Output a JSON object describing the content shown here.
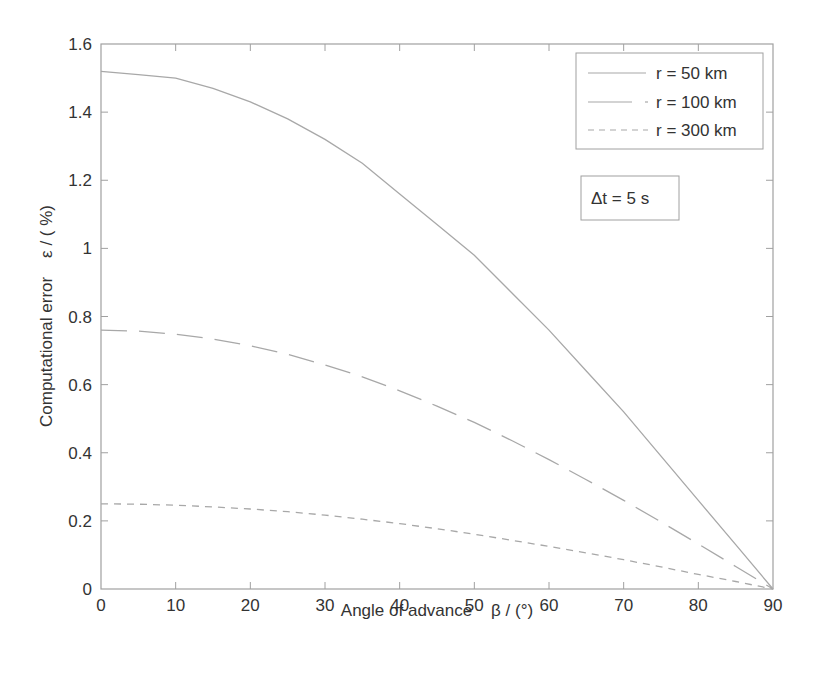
{
  "chart_data": {
    "type": "line",
    "title": "",
    "xlabel": "Angle of advance    β / (°)",
    "ylabel": "Computational error    ε / ( %)",
    "xlim": [
      0,
      90
    ],
    "ylim": [
      0,
      1.6
    ],
    "xticks": [
      0,
      10,
      20,
      30,
      40,
      50,
      60,
      70,
      80,
      90
    ],
    "yticks": [
      0,
      0.2,
      0.4,
      0.6,
      0.8,
      1,
      1.2,
      1.4,
      1.6
    ],
    "ytick_labels": [
      "0",
      "0.2",
      "0.4",
      "0.6",
      "0.8",
      "1",
      "1.2",
      "1.4",
      "1.6"
    ],
    "grid": false,
    "legend_position": "upper right",
    "x": [
      0,
      5,
      10,
      15,
      20,
      25,
      30,
      35,
      40,
      45,
      50,
      55,
      60,
      65,
      70,
      75,
      80,
      85,
      90
    ],
    "series": [
      {
        "name": "r = 50 km",
        "style": "solid",
        "values": [
          1.52,
          1.51,
          1.5,
          1.47,
          1.43,
          1.38,
          1.32,
          1.25,
          1.16,
          1.07,
          0.98,
          0.87,
          0.76,
          0.64,
          0.52,
          0.39,
          0.26,
          0.13,
          0.0
        ]
      },
      {
        "name": "r = 100 km",
        "style": "long-dash",
        "values": [
          0.76,
          0.757,
          0.748,
          0.734,
          0.714,
          0.689,
          0.658,
          0.623,
          0.582,
          0.537,
          0.489,
          0.436,
          0.38,
          0.321,
          0.26,
          0.197,
          0.132,
          0.066,
          0.0
        ]
      },
      {
        "name": "r = 300 km",
        "style": "short-dash",
        "values": [
          0.25,
          0.249,
          0.246,
          0.241,
          0.235,
          0.227,
          0.217,
          0.205,
          0.192,
          0.177,
          0.161,
          0.143,
          0.125,
          0.106,
          0.086,
          0.065,
          0.043,
          0.022,
          0.0
        ]
      }
    ],
    "annotations": [
      "Δt = 5 s"
    ]
  },
  "legend": {
    "items": [
      "r = 50 km",
      "r = 100 km",
      "r = 300 km"
    ]
  },
  "annotation": {
    "text": "Δt = 5 s"
  },
  "axes": {
    "xlabel": "Angle of advance    β / (°)",
    "ylabel": "Computational error    ε / ( %)"
  },
  "colors": {
    "axis": "#9a9a9a",
    "line": "#a8a8a8",
    "text": "#333333"
  }
}
